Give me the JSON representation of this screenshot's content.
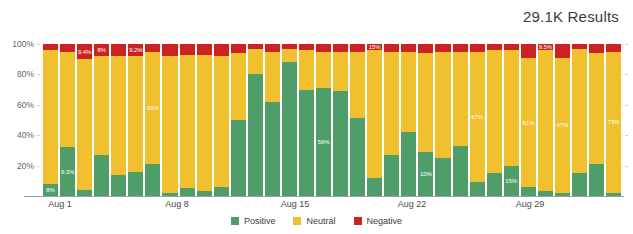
{
  "header": {
    "results_label": "29.1K Results"
  },
  "legend": {
    "position": "bottom-center",
    "items": [
      {
        "label": "Positive",
        "color": "#4f9e6a",
        "key": "positive"
      },
      {
        "label": "Neutral",
        "color": "#f0c02e",
        "key": "neutral"
      },
      {
        "label": "Negative",
        "color": "#cc2222",
        "key": "negative"
      }
    ]
  },
  "y_axis": {
    "ticks": [
      "100%",
      "80%",
      "60%",
      "40%",
      "20%"
    ],
    "values": [
      100,
      80,
      60,
      40,
      20
    ]
  },
  "x_axis": {
    "ticks": [
      "Aug 1",
      "Aug 8",
      "Aug 15",
      "Aug 22",
      "Aug 29"
    ],
    "tick_positions_px": [
      60,
      177,
      295,
      412,
      530
    ]
  },
  "chart_data": {
    "type": "bar",
    "stacked": true,
    "normalized_percent": true,
    "title": "29.1K Results",
    "xlabel": "",
    "ylabel": "",
    "ylim": [
      0,
      100
    ],
    "grid": true,
    "legend_position": "bottom-center",
    "colors": {
      "positive": "#4f9e6a",
      "neutral": "#f0c02e",
      "negative": "#cc2222",
      "gridline": "#c9d3e0",
      "axis": "#9aa4b0",
      "text": "#3c3c3c"
    },
    "categories": [
      "Aug 1",
      "Aug 2",
      "Aug 3",
      "Aug 4",
      "Aug 5",
      "Aug 6",
      "Aug 7",
      "Aug 8",
      "Aug 9",
      "Aug 10",
      "Aug 11",
      "Aug 12",
      "Aug 13",
      "Aug 14",
      "Aug 15",
      "Aug 16",
      "Aug 17",
      "Aug 18",
      "Aug 19",
      "Aug 20",
      "Aug 21",
      "Aug 22",
      "Aug 23",
      "Aug 24",
      "Aug 25",
      "Aug 26",
      "Aug 27",
      "Aug 28",
      "Aug 29",
      "Aug 30",
      "Aug 31",
      "Sep 1",
      "Sep 2",
      "Sep 3"
    ],
    "series": [
      {
        "name": "Positive",
        "key": "positive",
        "color": "#4f9e6a",
        "values": [
          8,
          32,
          4,
          27,
          14,
          16,
          21,
          2,
          5,
          3,
          6,
          50,
          80,
          62,
          88,
          70,
          71,
          69,
          51,
          12,
          27,
          42,
          29,
          25,
          33,
          9,
          15,
          20,
          6,
          3,
          2,
          15,
          21,
          2
        ]
      },
      {
        "name": "Neutral",
        "key": "neutral",
        "color": "#f0c02e",
        "values": [
          88,
          63,
          86,
          65,
          78,
          76,
          74,
          90,
          88,
          90,
          86,
          44,
          17,
          33,
          9,
          26,
          24,
          26,
          44,
          84,
          68,
          53,
          65,
          70,
          62,
          86,
          81,
          76,
          85,
          93,
          89,
          82,
          73,
          93
        ]
      },
      {
        "name": "Negative",
        "key": "negative",
        "color": "#cc2222",
        "values": [
          4,
          5,
          10,
          8,
          8,
          8,
          5,
          8,
          7,
          7,
          8,
          6,
          3,
          5,
          3,
          4,
          5,
          5,
          5,
          4,
          5,
          5,
          6,
          5,
          5,
          5,
          4,
          4,
          9.5,
          4,
          9,
          3,
          6,
          5
        ]
      }
    ],
    "data_labels": [
      {
        "bar": 0,
        "series": "positive",
        "text": "8%"
      },
      {
        "bar": 1,
        "series": "positive",
        "text": "9.3%"
      },
      {
        "bar": 2,
        "series": "negative",
        "text": "9.4%"
      },
      {
        "bar": 3,
        "series": "negative",
        "text": "8%"
      },
      {
        "bar": 5,
        "series": "negative",
        "text": "9.2%"
      },
      {
        "bar": 6,
        "series": "neutral",
        "text": "65%"
      },
      {
        "bar": 16,
        "series": "positive",
        "text": "56%"
      },
      {
        "bar": 19,
        "series": "negative",
        "text": "15%"
      },
      {
        "bar": 22,
        "series": "positive",
        "text": "10%"
      },
      {
        "bar": 25,
        "series": "neutral",
        "text": "67%"
      },
      {
        "bar": 27,
        "series": "positive",
        "text": "15%"
      },
      {
        "bar": 28,
        "series": "neutral",
        "text": "61%"
      },
      {
        "bar": 29,
        "series": "negative",
        "text": "9.5%"
      },
      {
        "bar": 30,
        "series": "neutral",
        "text": "47%"
      },
      {
        "bar": 33,
        "series": "neutral",
        "text": "73%"
      }
    ]
  }
}
